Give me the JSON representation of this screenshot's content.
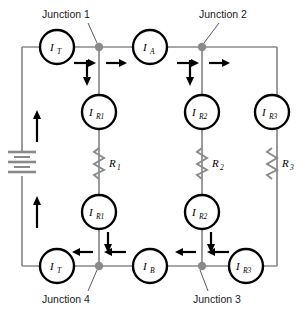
{
  "diagram": {
    "junctions": [
      {
        "id": "j1",
        "label": "Junction 1",
        "x": 99,
        "y": 47
      },
      {
        "id": "j2",
        "label": "Junction 2",
        "x": 202,
        "y": 47
      },
      {
        "id": "j3",
        "label": "Junction 3",
        "x": 202,
        "y": 266
      },
      {
        "id": "j4",
        "label": "Junction 4",
        "x": 99,
        "y": 266
      }
    ],
    "meters": [
      {
        "id": "m-it-top",
        "main": "I",
        "sub": "T",
        "x": 57,
        "y": 47
      },
      {
        "id": "m-ia",
        "main": "I",
        "sub": "A",
        "x": 150,
        "y": 47
      },
      {
        "id": "m-ir1-top",
        "main": "I",
        "sub": "R1",
        "x": 99,
        "y": 112
      },
      {
        "id": "m-ir2-top",
        "main": "I",
        "sub": "R2",
        "x": 202,
        "y": 112
      },
      {
        "id": "m-ir3",
        "main": "I",
        "sub": "R3",
        "x": 272,
        "y": 112
      },
      {
        "id": "m-ir1-bot",
        "main": "I",
        "sub": "R1",
        "x": 99,
        "y": 212
      },
      {
        "id": "m-ir2-bot",
        "main": "I",
        "sub": "R2",
        "x": 202,
        "y": 212
      },
      {
        "id": "m-it-bot",
        "main": "I",
        "sub": "T",
        "x": 57,
        "y": 266
      },
      {
        "id": "m-ib",
        "main": "I",
        "sub": "B",
        "x": 150,
        "y": 266
      },
      {
        "id": "m-ir3-bot",
        "main": "I",
        "sub": "R3",
        "x": 246,
        "y": 266
      }
    ],
    "resistors": [
      {
        "id": "r1",
        "main": "R",
        "sub": "1",
        "x": 99,
        "y": 163
      },
      {
        "id": "r2",
        "main": "R",
        "sub": "2",
        "x": 202,
        "y": 163
      },
      {
        "id": "r3",
        "main": "R",
        "sub": "3",
        "x": 272,
        "y": 163
      }
    ],
    "source": {
      "id": "battery",
      "x": 22,
      "y": 163,
      "type": "battery"
    },
    "colors": {
      "wire": "#8a8a8a",
      "meter_outline": "#000000",
      "arrow": "#000000",
      "junction_dot": "#8a8a8a",
      "text": "#1a1a1a",
      "background": "#ffffff"
    },
    "frame": {
      "left": 22,
      "right": 277,
      "top": 47,
      "bottom": 266
    }
  }
}
